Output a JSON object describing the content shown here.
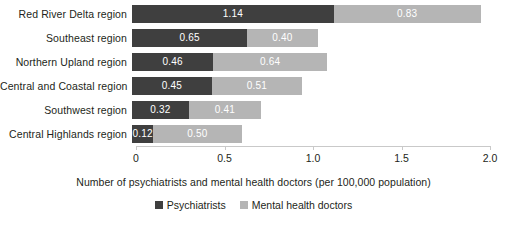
{
  "chart_data": {
    "type": "bar",
    "orientation": "horizontal",
    "stacked": true,
    "title": "",
    "xlabel": "Number of psychiatrists and mental health doctors (per 100,000 population)",
    "ylabel": "",
    "xlim": [
      0,
      2.0
    ],
    "xticks": [
      "0",
      "0.5",
      "1.0",
      "1.5",
      "2.0"
    ],
    "xtick_values": [
      0,
      0.5,
      1.0,
      1.5,
      2.0
    ],
    "grid": false,
    "legend_position": "bottom",
    "categories": [
      "Red River Delta region",
      "Southeast region",
      "Northern Upland region",
      "Central and Coastal region",
      "Southwest region",
      "Central Highlands region"
    ],
    "series": [
      {
        "name": "Psychiatrists",
        "color": "#3f3f3f",
        "values": [
          1.14,
          0.65,
          0.46,
          0.45,
          0.32,
          0.12
        ],
        "labels": [
          "1.14",
          "0.65",
          "0.46",
          "0.45",
          "0.32",
          "0.12"
        ]
      },
      {
        "name": "Mental health doctors",
        "color": "#b5b5b5",
        "values": [
          0.83,
          0.4,
          0.64,
          0.51,
          0.41,
          0.5
        ],
        "labels": [
          "0.83",
          "0.40",
          "0.64",
          "0.51",
          "0.41",
          "0.50"
        ]
      }
    ]
  },
  "colors": {
    "psychiatrists": "#3f3f3f",
    "mental_health_doctors": "#b5b5b5",
    "axis": "#c9c9c9",
    "text": "#231f20",
    "value_text": "#ffffff",
    "background": "#ffffff"
  }
}
